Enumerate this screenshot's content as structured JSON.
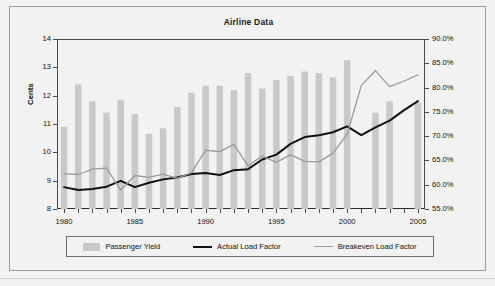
{
  "chart_data": {
    "type": "bar",
    "title": "Airline Data",
    "xlabel": "",
    "ylabel": "Cents",
    "y2label": "",
    "x": [
      1980,
      1981,
      1982,
      1983,
      1984,
      1985,
      1986,
      1987,
      1988,
      1989,
      1990,
      1991,
      1992,
      1993,
      1994,
      1995,
      1996,
      1997,
      1998,
      1999,
      2000,
      2001,
      2002,
      2003,
      2004,
      2005
    ],
    "categories": [
      "1980",
      "1981",
      "1982",
      "1983",
      "1984",
      "1985",
      "1986",
      "1987",
      "1988",
      "1989",
      "1990",
      "1991",
      "1992",
      "1993",
      "1994",
      "1995",
      "1996",
      "1997",
      "1998",
      "1999",
      "2000",
      "2001",
      "2002",
      "2003",
      "2004",
      "2005"
    ],
    "xlim": [
      1979.5,
      2005.5
    ],
    "ylim": [
      8,
      14
    ],
    "y2lim": [
      55,
      90
    ],
    "ytick_labels": [
      "8",
      "9",
      "10",
      "11",
      "12",
      "13",
      "14"
    ],
    "ytick_values": [
      8,
      9,
      10,
      11,
      12,
      13,
      14
    ],
    "y2tick_labels": [
      "55.0%",
      "60.0%",
      "65.0%",
      "70.0%",
      "75.0%",
      "80.0%",
      "85.0%",
      "90.0%"
    ],
    "y2tick_values": [
      55,
      60,
      65,
      70,
      75,
      80,
      85,
      90
    ],
    "xtick_labels": [
      "1980",
      "1985",
      "1990",
      "1995",
      "2000",
      "2005"
    ],
    "xtick_values": [
      1980,
      1985,
      1990,
      1995,
      2000,
      2005
    ],
    "grid": false,
    "legend_position": "bottom",
    "series": [
      {
        "name": "Passenger Yield",
        "type": "bar",
        "axis": "left",
        "unit": "cents",
        "color": "#c9c9c9",
        "values": [
          10.9,
          12.4,
          11.8,
          11.4,
          11.85,
          11.35,
          10.65,
          10.85,
          11.6,
          12.1,
          12.35,
          12.35,
          12.2,
          12.8,
          12.25,
          12.55,
          12.7,
          12.85,
          12.8,
          12.65,
          13.25,
          null,
          11.4,
          11.8,
          null,
          11.75
        ]
      },
      {
        "name": "Actual Load Factor",
        "type": "line",
        "axis": "right",
        "unit": "percent",
        "color": "#111111",
        "values": [
          59.5,
          58.9,
          59.1,
          59.6,
          60.8,
          59.5,
          60.4,
          61.1,
          61.5,
          62.2,
          62.4,
          62.0,
          63.0,
          63.2,
          65.2,
          66.2,
          68.4,
          69.8,
          70.2,
          70.8,
          72.0,
          70.2,
          71.8,
          73.2,
          75.3,
          77.2
        ]
      },
      {
        "name": "Breakeven Load Factor",
        "type": "line",
        "axis": "right",
        "unit": "percent",
        "color": "#9a9a9a",
        "values": [
          62.3,
          62.1,
          63.2,
          63.4,
          58.9,
          61.9,
          61.5,
          62.2,
          61.3,
          62.5,
          67.1,
          66.8,
          68.3,
          63.9,
          65.9,
          64.6,
          66.2,
          64.8,
          64.7,
          66.5,
          70.4,
          80.4,
          83.5,
          80.2,
          81.3,
          82.6
        ]
      }
    ]
  },
  "legend": {
    "items": [
      {
        "label": "Passenger Yield",
        "marker": "bar-swatch"
      },
      {
        "label": "Actual Load Factor",
        "marker": "line-swatch-dark"
      },
      {
        "label": "Breakeven Load Factor",
        "marker": "line-swatch-light"
      }
    ]
  },
  "colors": {
    "bar": "#c9c9c9",
    "actual_line": "#111111",
    "breakeven_line": "#9a9a9a",
    "plot_background": "#f2f2f2",
    "frame": "#9a9a9a",
    "axis": "#4a4a4a"
  }
}
